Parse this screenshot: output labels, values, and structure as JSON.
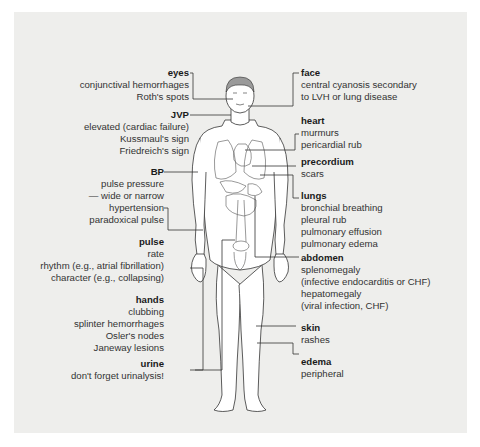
{
  "diagram": {
    "title": "",
    "background_color": "#eeeeec",
    "left_labels": [
      {
        "heading": "eyes",
        "lines": [
          "conjunctival hemorrhages",
          "Roth's spots"
        ]
      },
      {
        "heading": "JVP",
        "lines": [
          "elevated (cardiac failure)",
          "Kussmaul's sign",
          "Friedreich's sign"
        ]
      },
      {
        "heading": "BP",
        "lines": [
          "pulse pressure",
          "— wide or narrow",
          "hypertension",
          "paradoxical pulse"
        ]
      },
      {
        "heading": "pulse",
        "lines": [
          "rate",
          "rhythm (e.g., atrial fibrillation)",
          "character (e.g., collapsing)"
        ]
      },
      {
        "heading": "hands",
        "lines": [
          "clubbing",
          "splinter hemorrhages",
          "Osler's nodes",
          "Janeway lesions"
        ]
      },
      {
        "heading": "urine",
        "lines": [
          "don't forget urinalysis!"
        ]
      }
    ],
    "right_labels": [
      {
        "heading": "face",
        "lines": [
          "central cyanosis secondary",
          "to LVH or lung disease"
        ]
      },
      {
        "heading": "heart",
        "lines": [
          "murmurs",
          "pericardial rub"
        ]
      },
      {
        "heading": "precordium",
        "lines": [
          "scars"
        ]
      },
      {
        "heading": "lungs",
        "lines": [
          "bronchial breathing",
          "pleural rub",
          "pulmonary effusion",
          "pulmonary edema"
        ]
      },
      {
        "heading": "abdomen",
        "lines": [
          "splenomegaly",
          "(infective endocarditis or CHF)",
          "hepatomegaly",
          "(viral infection, CHF)"
        ]
      },
      {
        "heading": "skin",
        "lines": [
          "rashes"
        ]
      },
      {
        "heading": "edema",
        "lines": [
          "peripheral"
        ]
      }
    ],
    "figure": {
      "icon": "human-body-figure-icon",
      "description": "front view of male body with heart, lungs and abdominal organs outlined"
    }
  }
}
